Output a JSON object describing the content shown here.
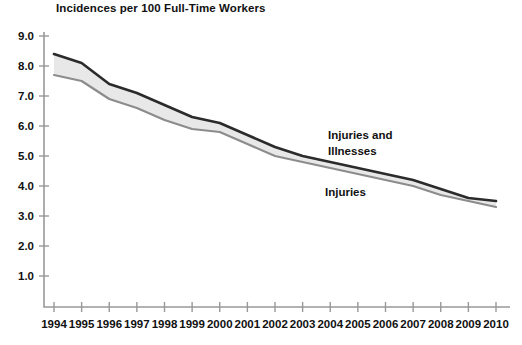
{
  "chart_data": {
    "type": "line",
    "title": "Incidences per 100 Full-Time Workers",
    "xlabel": "",
    "ylabel": "",
    "ylim": [
      0,
      9.0
    ],
    "xlim": [
      1994,
      2010
    ],
    "grid": false,
    "legend_position": "inline-annotation",
    "x": [
      1994,
      1995,
      1996,
      1997,
      1998,
      1999,
      2000,
      2001,
      2002,
      2003,
      2004,
      2005,
      2006,
      2007,
      2008,
      2009,
      2010
    ],
    "ytick_labels": [
      "1.0",
      "2.0",
      "3.0",
      "4.0",
      "5.0",
      "6.0",
      "7.0",
      "8.0",
      "9.0"
    ],
    "ytick_values": [
      1.0,
      2.0,
      3.0,
      4.0,
      5.0,
      6.0,
      7.0,
      8.0,
      9.0
    ],
    "xtick_labels": [
      "1994",
      "1995",
      "1996",
      "1997",
      "1998",
      "1999",
      "2000",
      "2001",
      "2002",
      "2003",
      "2004",
      "2005",
      "2006",
      "2007",
      "2008",
      "2009",
      "2010"
    ],
    "series": [
      {
        "name": "Injuries and Illnesses",
        "color": "#2b2b2b",
        "values": [
          8.4,
          8.1,
          7.4,
          7.1,
          6.7,
          6.3,
          6.1,
          5.7,
          5.3,
          5.0,
          4.8,
          4.6,
          4.4,
          4.2,
          3.9,
          3.6,
          3.5
        ]
      },
      {
        "name": "Injuries",
        "color": "#8c8c8c",
        "values": [
          7.7,
          7.5,
          6.9,
          6.6,
          6.2,
          5.9,
          5.8,
          5.4,
          5.0,
          4.8,
          4.6,
          4.4,
          4.2,
          4.0,
          3.7,
          3.5,
          3.3
        ]
      }
    ],
    "annotations": [
      {
        "text_line1": "Injuries and",
        "text_line2": "Illnesses",
        "series": "Injuries and Illnesses"
      },
      {
        "text_line1": "Injuries",
        "text_line2": "",
        "series": "Injuries"
      }
    ],
    "band_color": "#e8e8e8",
    "axis_color": "#999999"
  }
}
